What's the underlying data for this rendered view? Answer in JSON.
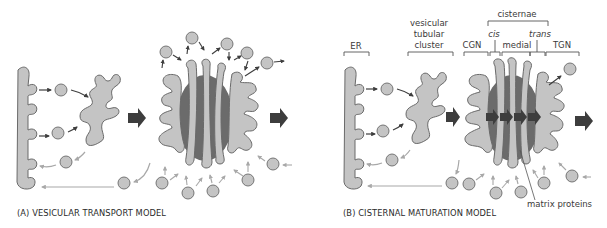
{
  "colors": {
    "membrane_fill": "#c4c4c4",
    "membrane_stroke": "#6a6a6a",
    "matrix_fill": "#6b6b6b",
    "dark_arrow": "#3d3d3d",
    "light_arrow": "#a8a8a8",
    "bracket": "#555555",
    "text": "#333333"
  },
  "panels": [
    {
      "id": "A",
      "caption": "(A)   VESICULAR TRANSPORT MODEL"
    },
    {
      "id": "B",
      "caption": "(B)   CISTERNAL MATURATION MODEL",
      "labels": {
        "er": "ER",
        "vtc_line1": "vesicular",
        "vtc_line2": "tubular",
        "vtc_line3": "cluster",
        "cisternae": "cisternae",
        "cgn": "CGN",
        "cis": "cis",
        "medial": "medial",
        "trans": "trans",
        "tgn": "TGN",
        "matrix_proteins": "matrix proteins"
      }
    }
  ]
}
